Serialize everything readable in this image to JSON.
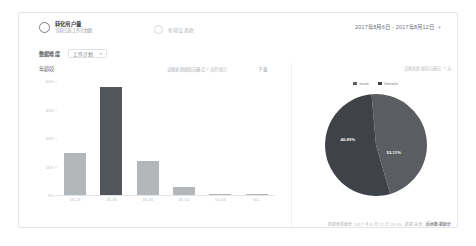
{
  "header": {
    "primary_metric": {
      "label": "转化用户量",
      "sublabel": "当前已选工作计划数"
    },
    "secondary_metric": {
      "label": "新增设备数"
    },
    "date_range": "2017年8月6日 - 2017年8月12日",
    "date_caret": "▾"
  },
  "filter": {
    "label": "数据维度",
    "selected": "工作计划",
    "caret": "▾"
  },
  "bar_panel": {
    "title": "年龄段",
    "note": "该图表数据取自最近 7 天的统计",
    "action_label": "下载"
  },
  "pie_panel": {
    "caption": "该图表数据取自最近 7 天",
    "footer_note": "数据更新截至 2017 年 8 月 12 日 23:59，数据来源：",
    "footer_strong": "后台数据统计"
  },
  "colors": {
    "bar_default": "#b3b7ba",
    "bar_highlight": "#53565a",
    "pie_male": "#5a5d61",
    "pie_female": "#3f4246",
    "card_border": "#e4e6e8"
  },
  "chart_data": [
    {
      "type": "bar",
      "title": "年龄段",
      "xlabel": "",
      "ylabel": "",
      "ylim": [
        0,
        60
      ],
      "grid": false,
      "categories": [
        "18-24",
        "25-34",
        "35-44",
        "45-54",
        "55-64",
        "65+"
      ],
      "values": [
        22,
        57,
        18,
        4,
        0.5,
        0.5
      ],
      "highlight_index": 1,
      "ytick_labels": [
        "60%",
        "45%",
        "30%",
        "15%",
        "0%"
      ],
      "ytick_values": [
        60,
        45,
        30,
        15,
        0
      ]
    },
    {
      "type": "pie",
      "title": "",
      "legend_position": "top",
      "labels": [
        "male",
        "female"
      ],
      "values": [
        46.89,
        53.11
      ],
      "display_labels": [
        "46.89%",
        "53.11%"
      ]
    }
  ]
}
